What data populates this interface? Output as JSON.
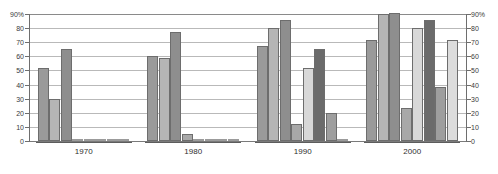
{
  "chart_data": {
    "type": "bar",
    "title": "",
    "subtitle": "",
    "xlabel": "",
    "ylabel": "",
    "ylim": [
      0,
      90
    ],
    "grid": true,
    "legend_position": "none",
    "orientation": "vertical",
    "grouped": true,
    "categories": [
      "1970",
      "1980",
      "1990",
      "2000"
    ],
    "y_ticks": [
      0,
      10,
      20,
      30,
      40,
      50,
      60,
      70,
      80,
      90
    ],
    "y_tick_labels_left": [
      "0",
      "10",
      "20",
      "30",
      "40",
      "50",
      "60",
      "70",
      "80",
      "90%"
    ],
    "y_tick_labels_right": [
      "0",
      "10",
      "20",
      "30",
      "40",
      "50",
      "60",
      "70",
      "80",
      "90%"
    ],
    "axis_left_visible": true,
    "axis_right_visible": true,
    "value_unit": "%",
    "series": [
      {
        "name": "Series 1",
        "color": "#9a9a9a",
        "values": [
          52,
          60.5,
          67,
          71.5
        ]
      },
      {
        "name": "Series 2",
        "color": "#b5b5b5",
        "values": [
          30,
          58.5,
          80,
          90
        ]
      },
      {
        "name": "Series 3",
        "color": "#8e8e8e",
        "values": [
          65,
          77.5,
          86,
          90.5
        ]
      },
      {
        "name": "Series 4",
        "color": "#a8a8a8",
        "values": [
          0.7,
          5,
          12,
          23.5
        ]
      },
      {
        "name": "Series 5",
        "color": "#d8d8d8",
        "values": [
          0.7,
          0.7,
          52,
          80
        ]
      },
      {
        "name": "Series 6",
        "color": "#6b6b6b",
        "values": [
          0.7,
          0.7,
          65,
          86
        ]
      },
      {
        "name": "Series 7",
        "color": "#9e9e9e",
        "values": [
          0.7,
          0.7,
          20,
          38
        ]
      },
      {
        "name": "Series 8",
        "color": "#dcdcdc",
        "values": [
          0.7,
          0.7,
          0.7,
          71.5
        ]
      }
    ]
  },
  "style": {
    "plot_background": "#ffffff",
    "gridline_color": "#b9b9b9",
    "axis_color": "#6e6e6e",
    "bar_border_color": "#6d6d6d",
    "label_color": "#2e2e2e"
  }
}
